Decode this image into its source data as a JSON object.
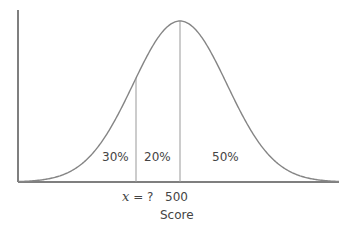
{
  "diagram": {
    "type": "normal-distribution",
    "mean_label": "500",
    "unknown_label_var": "x",
    "unknown_label_rest": " = ?",
    "axis_label": "Score",
    "regions": [
      {
        "label": "30%",
        "position": "left-tail"
      },
      {
        "label": "20%",
        "position": "between-x-and-mean"
      },
      {
        "label": "50%",
        "position": "right-of-mean"
      }
    ],
    "colors": {
      "axis": "#555555",
      "curve": "#858585",
      "divider": "#999999",
      "text": "#444444"
    },
    "geometry": {
      "origin_x": 18,
      "baseline_y": 182,
      "axis_top_y": 10,
      "axis_right_x": 339,
      "peak_x": 180,
      "peak_y": 21,
      "sigma_px": 47,
      "x_line": 136
    }
  }
}
